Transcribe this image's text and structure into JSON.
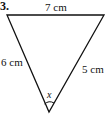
{
  "problem": {
    "number": "3.",
    "sides": {
      "top": "7 cm",
      "left": "6 cm",
      "right": "5 cm"
    },
    "angle_label": "x"
  },
  "colors": {
    "stroke": "#111111",
    "background": "#ffffff"
  }
}
